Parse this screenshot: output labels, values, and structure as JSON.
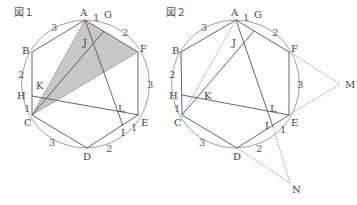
{
  "figure1": {
    "title": "図１",
    "points": {
      "A": {
        "label": "A",
        "x": 85,
        "y": 20
      },
      "G": {
        "label": "G",
        "x": 104,
        "y": 31
      },
      "F": {
        "label": "F",
        "x": 138,
        "y": 52
      },
      "B": {
        "label": "B",
        "x": 32,
        "y": 52
      },
      "H": {
        "label": "H",
        "x": 32,
        "y": 96
      },
      "C": {
        "label": "C",
        "x": 32,
        "y": 115
      },
      "D": {
        "label": "D",
        "x": 87,
        "y": 148
      },
      "I": {
        "label": "I",
        "x": 123,
        "y": 126
      },
      "E": {
        "label": "E",
        "x": 139,
        "y": 115
      },
      "K": {
        "label": "K",
        "x": 46,
        "y": 99
      },
      "J": {
        "label": "J",
        "x": 92,
        "y": 40
      },
      "L": {
        "label": "L",
        "x": 118,
        "y": 118
      }
    },
    "arc_ratios": {
      "AG": "1",
      "GF": "2",
      "FE": "3",
      "EI": "1",
      "ID": "2",
      "DC": "3",
      "CH": "1",
      "HB": "2",
      "BA": "3"
    },
    "shaded_triangle": [
      "A",
      "F",
      "C"
    ]
  },
  "figure2": {
    "title": "図２",
    "points": {
      "A": {
        "label": "A",
        "x": 236,
        "y": 20
      },
      "G": {
        "label": "G",
        "x": 254,
        "y": 31
      },
      "F": {
        "label": "F",
        "x": 289,
        "y": 52
      },
      "B": {
        "label": "B",
        "x": 181,
        "y": 52
      },
      "H": {
        "label": "H",
        "x": 182,
        "y": 95
      },
      "C": {
        "label": "C",
        "x": 182,
        "y": 115
      },
      "D": {
        "label": "D",
        "x": 237,
        "y": 148
      },
      "I": {
        "label": "I",
        "x": 273,
        "y": 127
      },
      "E": {
        "label": "E",
        "x": 289,
        "y": 115
      },
      "K": {
        "label": "K",
        "x": 197,
        "y": 96
      },
      "J": {
        "label": "J",
        "x": 240,
        "y": 40
      },
      "L": {
        "label": "L",
        "x": 268,
        "y": 111
      },
      "M": {
        "label": "M",
        "x": 340,
        "y": 84
      },
      "N": {
        "label": "N",
        "x": 290,
        "y": 183
      }
    },
    "arc_ratios": {
      "AG": "1",
      "GF": "2",
      "FE": "3",
      "EI": "1",
      "ID": "2",
      "DC": "3",
      "CH": "1",
      "HB": "2",
      "BA": "3"
    }
  }
}
